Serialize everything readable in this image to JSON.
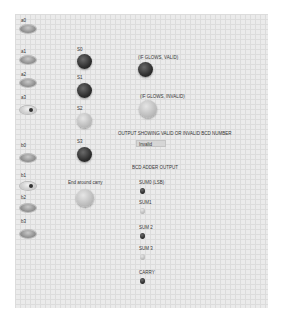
{
  "panel": {
    "switches": [
      {
        "id": "a0",
        "label": "a0",
        "state": "off"
      },
      {
        "id": "a1",
        "label": "a1",
        "state": "off"
      },
      {
        "id": "a2",
        "label": "a2",
        "state": "off"
      },
      {
        "id": "a3",
        "label": "a3",
        "state": "on"
      },
      {
        "id": "b0",
        "label": "b0",
        "state": "off"
      },
      {
        "id": "b1",
        "label": "b1",
        "state": "on"
      },
      {
        "id": "b2",
        "label": "b2",
        "state": "off"
      },
      {
        "id": "b3",
        "label": "b3",
        "state": "off"
      }
    ],
    "sum_leds": [
      {
        "id": "s0",
        "label": "S0",
        "state": "off"
      },
      {
        "id": "s1",
        "label": "S1",
        "state": "off"
      },
      {
        "id": "s2",
        "label": "S2",
        "state": "on"
      },
      {
        "id": "s3",
        "label": "S3",
        "state": "off"
      }
    ],
    "end_around_carry": {
      "label": "End around carry",
      "state": "on"
    },
    "valid_led": {
      "label": "(IF GLOWS, VALID)",
      "state": "off"
    },
    "invalid_led": {
      "label": "(IF GLOWS, INVALID)",
      "state": "on"
    },
    "output_status": {
      "label": "OUTPUT SHOWING VALID OR INVALID BCD NUMBER",
      "value": "Invalid"
    },
    "bcd_adder_output": {
      "label": "BCD ADDER OUTPUT",
      "leds": [
        {
          "id": "sum0",
          "label": "SUM0 (LSB)",
          "state": "off"
        },
        {
          "id": "sum1",
          "label": "SUM1",
          "state": "on"
        },
        {
          "id": "sum2",
          "label": "SUM 2",
          "state": "off"
        },
        {
          "id": "sum3",
          "label": "SUM 3",
          "state": "on"
        },
        {
          "id": "carry",
          "label": "CARRY",
          "state": "off"
        }
      ]
    }
  }
}
